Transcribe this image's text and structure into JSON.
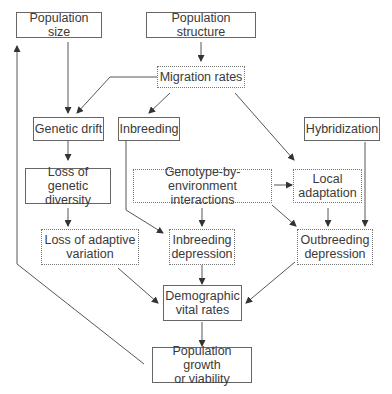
{
  "diagram": {
    "nodes": {
      "population_size": "Population size",
      "population_structure": "Population structure",
      "migration_rates": "Migration rates",
      "genetic_drift": "Genetic drift",
      "inbreeding": "Inbreeding",
      "hybridization": "Hybridization",
      "loss_genetic_diversity": "Loss of genetic\ndiversity",
      "gxe_interactions": "Genotype-by-environment\ninteractions",
      "local_adaptation": "Local\nadaptation",
      "loss_adaptive_variation": "Loss of adaptive\nvariation",
      "inbreeding_depression": "Inbreeding\ndepression",
      "outbreeding_depression": "Outbreeding\ndepression",
      "demographic_vital_rates": "Demographic\nvital rates",
      "population_growth": "Population growth\nor viability"
    },
    "edges": [
      [
        "population_size",
        "genetic_drift"
      ],
      [
        "population_structure",
        "migration_rates"
      ],
      [
        "migration_rates",
        "genetic_drift"
      ],
      [
        "migration_rates",
        "inbreeding"
      ],
      [
        "migration_rates",
        "local_adaptation"
      ],
      [
        "genetic_drift",
        "loss_genetic_diversity"
      ],
      [
        "loss_genetic_diversity",
        "loss_adaptive_variation"
      ],
      [
        "inbreeding",
        "inbreeding_depression"
      ],
      [
        "gxe_interactions",
        "local_adaptation"
      ],
      [
        "gxe_interactions",
        "inbreeding_depression"
      ],
      [
        "gxe_interactions",
        "outbreeding_depression"
      ],
      [
        "local_adaptation",
        "outbreeding_depression"
      ],
      [
        "hybridization",
        "outbreeding_depression"
      ],
      [
        "loss_adaptive_variation",
        "demographic_vital_rates"
      ],
      [
        "inbreeding_depression",
        "demographic_vital_rates"
      ],
      [
        "outbreeding_depression",
        "demographic_vital_rates"
      ],
      [
        "demographic_vital_rates",
        "population_growth"
      ],
      [
        "population_growth",
        "population_size"
      ]
    ],
    "colors": {
      "line": "#444444",
      "text": "#3a3a3a"
    }
  }
}
